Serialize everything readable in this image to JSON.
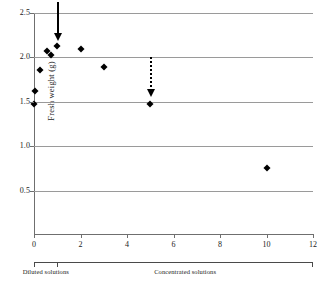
{
  "chart_data": {
    "type": "scatter",
    "title": "",
    "xlabel": "",
    "ylabel": "Fresh weight (g)",
    "xlim": [
      0,
      12
    ],
    "ylim": [
      0,
      2.5
    ],
    "grid": true,
    "legend": "none",
    "x_ticks": [
      "0",
      "2",
      "4",
      "6",
      "8",
      "10",
      "12"
    ],
    "x_tick_values": [
      0,
      2,
      4,
      6,
      8,
      10,
      12
    ],
    "y_ticks": [
      "0.5",
      "1.0",
      "1.5",
      "2.0",
      "2.5"
    ],
    "y_tick_values": [
      0.5,
      1.0,
      1.5,
      2.0,
      2.5
    ],
    "series": [
      {
        "name": "Fresh weight",
        "marker": "diamond",
        "color": "#000000",
        "points": [
          {
            "x": 0.0,
            "y": 1.48
          },
          {
            "x": 0.05,
            "y": 1.62
          },
          {
            "x": 0.25,
            "y": 1.86
          },
          {
            "x": 0.55,
            "y": 2.07
          },
          {
            "x": 0.75,
            "y": 2.03
          },
          {
            "x": 1.0,
            "y": 2.13
          },
          {
            "x": 2.0,
            "y": 2.1
          },
          {
            "x": 3.0,
            "y": 1.89
          },
          {
            "x": 5.0,
            "y": 1.47
          },
          {
            "x": 10.0,
            "y": 0.75
          }
        ]
      }
    ],
    "annotations": [
      {
        "name": "solid-arrow",
        "style": "solid",
        "x": 1.0,
        "y_top": 2.62,
        "y_tip": 2.2
      },
      {
        "name": "dotted-arrow",
        "style": "dotted",
        "x": 5.0,
        "y_top": 2.0,
        "y_tip": 1.56
      }
    ],
    "category_axis": {
      "groups": [
        {
          "label": "Diluted solutions",
          "x_start": 0,
          "x_end": 1
        },
        {
          "label": "Concentrated solutions",
          "x_start": 1,
          "x_end": 12
        }
      ]
    }
  }
}
